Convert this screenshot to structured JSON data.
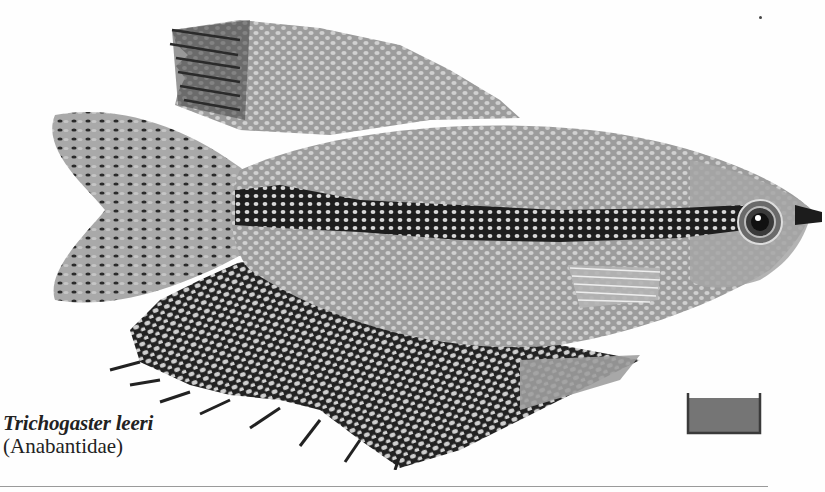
{
  "figure": {
    "colors": {
      "body": "#9c9c9c",
      "spots": "#d2d2d2",
      "stripe": "#1e1e1e",
      "dark_fin": "#222222",
      "tail": "#a8a8a8",
      "outline": "#555555"
    }
  },
  "caption": {
    "species": "Trichogaster leeri",
    "family": "(Anabantidae)"
  },
  "tank_icon": {
    "name": "aquarium-tank-icon",
    "fill": "#757575",
    "border": "#3a3a3a"
  }
}
